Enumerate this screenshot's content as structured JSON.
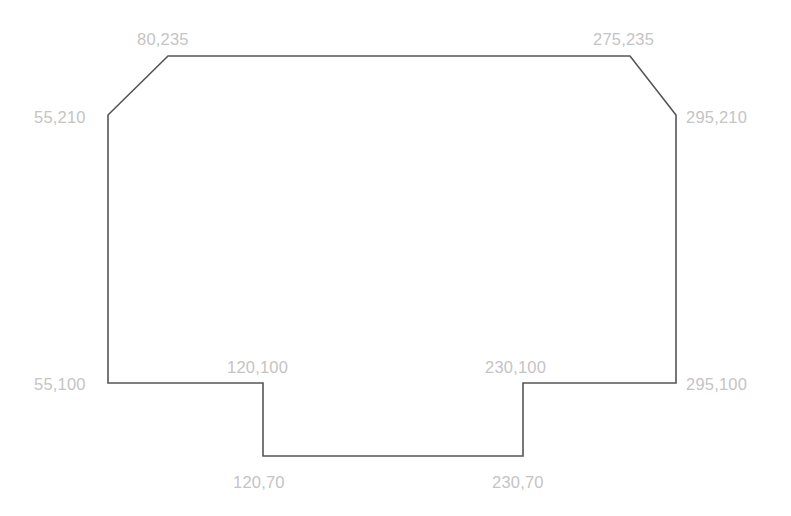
{
  "diagram": {
    "type": "polygon-floor-plan",
    "stroke_color": "#555555",
    "label_color": "#c4c4c4",
    "vertices": [
      {
        "x": 80,
        "y": 235,
        "label": "80,235",
        "px": 168,
        "py": 56,
        "lx": 137,
        "ly": 31,
        "anchor": "top"
      },
      {
        "x": 275,
        "y": 235,
        "label": "275,235",
        "px": 630,
        "py": 56,
        "lx": 593,
        "ly": 31,
        "anchor": "top"
      },
      {
        "x": 295,
        "y": 210,
        "label": "295,210",
        "px": 676,
        "py": 115,
        "lx": 686,
        "ly": 109,
        "anchor": "right"
      },
      {
        "x": 295,
        "y": 100,
        "label": "295,100",
        "px": 676,
        "py": 383,
        "lx": 686,
        "ly": 376,
        "anchor": "right"
      },
      {
        "x": 230,
        "y": 100,
        "label": "230,100",
        "px": 523,
        "py": 383,
        "lx": 485,
        "ly": 359,
        "anchor": "top"
      },
      {
        "x": 230,
        "y": 70,
        "label": "230,70",
        "px": 523,
        "py": 456,
        "lx": 492,
        "ly": 474,
        "anchor": "bottom"
      },
      {
        "x": 120,
        "y": 70,
        "label": "120,70",
        "px": 263,
        "py": 456,
        "lx": 233,
        "ly": 474,
        "anchor": "bottom"
      },
      {
        "x": 120,
        "y": 100,
        "label": "120,100",
        "px": 263,
        "py": 383,
        "lx": 227,
        "ly": 359,
        "anchor": "top"
      },
      {
        "x": 55,
        "y": 100,
        "label": "55,100",
        "px": 108,
        "py": 383,
        "lx": 34,
        "ly": 376,
        "anchor": "left"
      },
      {
        "x": 55,
        "y": 210,
        "label": "55,210",
        "px": 108,
        "py": 115,
        "lx": 34,
        "ly": 109,
        "anchor": "left"
      }
    ]
  }
}
